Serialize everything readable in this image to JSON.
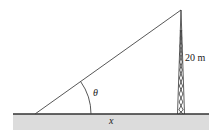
{
  "diagram": {
    "labels": {
      "height": "20 m",
      "angle": "θ",
      "base": "x"
    },
    "colors": {
      "ground_fill": "#d9d9d9",
      "line": "#333333",
      "text": "#222222",
      "background": "#ffffff"
    }
  }
}
